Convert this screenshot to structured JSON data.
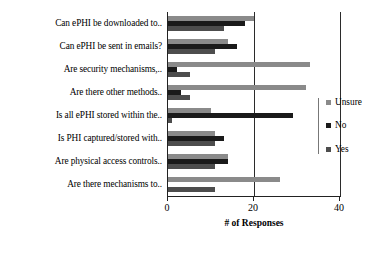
{
  "chart_data": {
    "type": "bar",
    "orientation": "horizontal",
    "title": "",
    "xlabel": "# of Responses",
    "ylabel": "",
    "xlim": [
      0,
      40
    ],
    "xticks": [
      0,
      20,
      40
    ],
    "xtick_labels": [
      "0",
      "20",
      "40"
    ],
    "grid": true,
    "legend_position": "right",
    "categories": [
      "Can ePHI be downloaded to..",
      "Can ePHI be sent in emails?",
      "Are security mechanisms,..",
      "Are there other methods..",
      "Is all ePHI stored within the..",
      "Is PHI captured/stored with..",
      "Are physical access controls..",
      "Are there mechanisms to.."
    ],
    "series": [
      {
        "name": "Unsure",
        "color": "#8a8a8a",
        "values": [
          20,
          14,
          33,
          32,
          10,
          11,
          14,
          26
        ]
      },
      {
        "name": "No",
        "color": "#1a1a1a",
        "values": [
          18,
          16,
          2,
          3,
          29,
          13,
          14,
          0
        ]
      },
      {
        "name": "Yes",
        "color": "#4d4d4d",
        "values": [
          13,
          11,
          5,
          5,
          1,
          11,
          11,
          11
        ]
      }
    ]
  },
  "legend": {
    "items": [
      {
        "label": "Unsure"
      },
      {
        "label": "No"
      },
      {
        "label": "Yes"
      }
    ]
  }
}
